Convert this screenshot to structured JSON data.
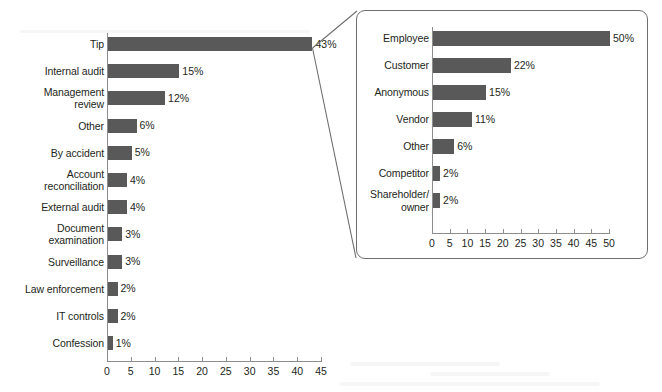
{
  "chart_data": [
    {
      "id": "main",
      "type": "bar",
      "orientation": "horizontal",
      "title": "",
      "xlabel": "",
      "ylabel": "",
      "xlim": [
        0,
        45
      ],
      "xticks": [
        "0",
        "5",
        "10",
        "15",
        "20",
        "25",
        "30",
        "35",
        "40",
        "45"
      ],
      "grid": false,
      "legend": "none",
      "bar_color": "#595959",
      "categories": [
        "Tip",
        "Internal audit",
        "Management\nreview",
        "Other",
        "By accident",
        "Account\nreconciliation",
        "External audit",
        "Document\nexamination",
        "Surveillance",
        "Law enforcement",
        "IT controls",
        "Confession"
      ],
      "values": [
        43,
        15,
        12,
        6,
        5,
        4,
        4,
        3,
        3,
        2,
        2,
        1
      ],
      "value_labels": [
        "43%",
        "15%",
        "12%",
        "6%",
        "5%",
        "4%",
        "4%",
        "3%",
        "3%",
        "2%",
        "2%",
        "1%"
      ]
    },
    {
      "id": "inset",
      "type": "bar",
      "orientation": "horizontal",
      "title": "",
      "xlabel": "",
      "ylabel": "",
      "xlim": [
        0,
        50
      ],
      "xticks": [
        "0",
        "5",
        "10",
        "15",
        "20",
        "25",
        "30",
        "35",
        "40",
        "45",
        "50"
      ],
      "grid": false,
      "legend": "none",
      "bar_color": "#595959",
      "categories": [
        "Employee",
        "Customer",
        "Anonymous",
        "Vendor",
        "Other",
        "Competitor",
        "Shareholder/\nowner"
      ],
      "values": [
        50,
        22,
        15,
        11,
        6,
        2,
        2
      ],
      "value_labels": [
        "50%",
        "22%",
        "15%",
        "11%",
        "6%",
        "2%",
        "2%"
      ]
    }
  ]
}
